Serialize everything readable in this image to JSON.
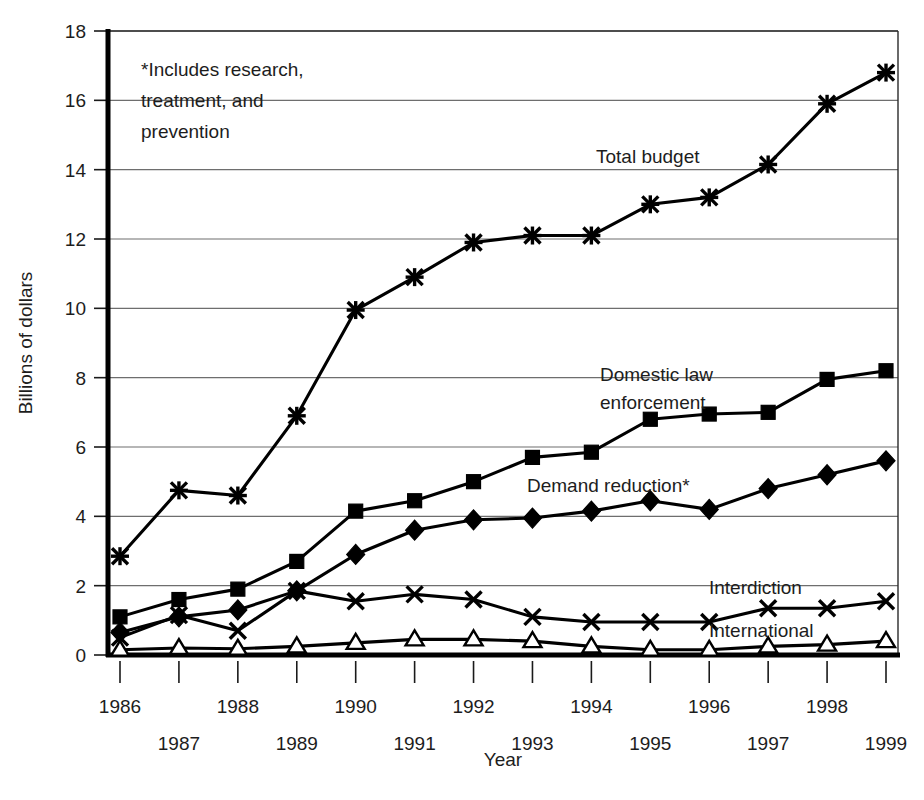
{
  "chart_data": {
    "type": "line",
    "title": "",
    "xlabel": "Year",
    "ylabel": "Billions of dollars",
    "grid": true,
    "legend_position": "inline-annotations",
    "xlim": [
      1986,
      1999
    ],
    "ylim": [
      0,
      18
    ],
    "ytick_step": 2,
    "yticks": [
      0,
      2,
      4,
      6,
      8,
      10,
      12,
      14,
      16,
      18
    ],
    "ytick_labels": [
      "0",
      "2",
      "4",
      "6",
      "8",
      "10",
      "12",
      "14",
      "16",
      "18"
    ],
    "categories": [
      1986,
      1987,
      1988,
      1989,
      1990,
      1991,
      1992,
      1993,
      1994,
      1995,
      1996,
      1997,
      1998,
      1999
    ],
    "xtick_labels": [
      "1986",
      "1987",
      "1988",
      "1989",
      "1990",
      "1991",
      "1992",
      "1993",
      "1994",
      "1995",
      "1996",
      "1997",
      "1998",
      "1999"
    ],
    "annotations": [
      {
        "name": "footnote-note",
        "lines": [
          "*Includes research,",
          "treatment, and",
          "prevention"
        ]
      }
    ],
    "series": [
      {
        "name": "Total budget",
        "marker": "star",
        "label": "Total budget",
        "values": [
          2.85,
          4.75,
          4.6,
          6.9,
          9.95,
          10.9,
          11.9,
          12.1,
          12.1,
          13.0,
          13.2,
          14.15,
          15.9,
          16.8
        ]
      },
      {
        "name": "Domestic law enforcement",
        "marker": "square",
        "label": "Domestic law enforcement",
        "values": [
          1.1,
          1.6,
          1.9,
          2.7,
          4.15,
          4.45,
          5.0,
          5.7,
          5.85,
          6.8,
          6.95,
          7.0,
          7.95,
          8.2
        ]
      },
      {
        "name": "Demand reduction*",
        "marker": "diamond",
        "label": "Demand reduction*",
        "values": [
          0.65,
          1.1,
          1.3,
          1.85,
          2.9,
          3.6,
          3.9,
          3.95,
          4.15,
          4.45,
          4.2,
          4.8,
          5.2,
          5.6
        ]
      },
      {
        "name": "Interdiction",
        "marker": "cross",
        "label": "Interdiction",
        "values": [
          0.5,
          1.15,
          0.7,
          1.85,
          1.55,
          1.75,
          1.6,
          1.1,
          0.95,
          0.95,
          0.95,
          1.35,
          1.35,
          1.55
        ]
      },
      {
        "name": "International",
        "marker": "triangle-open",
        "label": "International",
        "values": [
          0.15,
          0.2,
          0.18,
          0.25,
          0.35,
          0.45,
          0.45,
          0.4,
          0.25,
          0.15,
          0.15,
          0.25,
          0.3,
          0.4
        ]
      }
    ]
  }
}
